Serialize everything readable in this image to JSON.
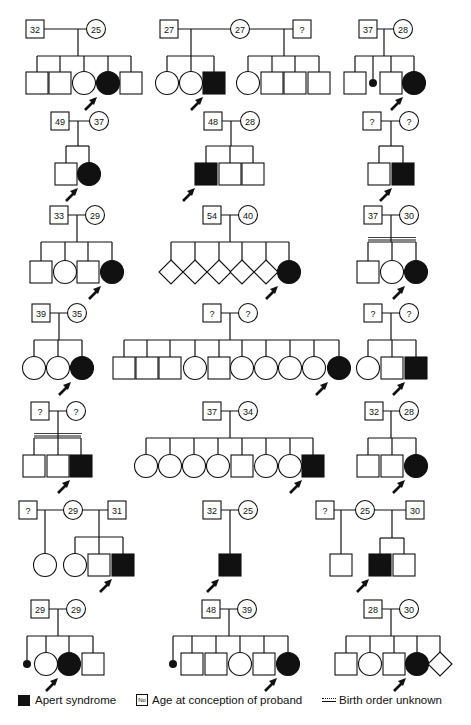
{
  "legend": {
    "affected_label": "Apert syndrome",
    "age_symbol_text": "No",
    "age_label": "Age at conception of proband",
    "birth_order_label": "Birth order unknown"
  },
  "pedigrees": [
    {
      "id": "p1",
      "father": "32",
      "mother": "25",
      "children": [
        "M",
        "M",
        "F",
        "F*",
        "M"
      ]
    },
    {
      "id": "p2",
      "father": "27",
      "mother": "27",
      "second_father": "?",
      "children_first": [
        "F",
        "F",
        "M*"
      ],
      "children_second": [
        "F",
        "M",
        "M",
        "M"
      ]
    },
    {
      "id": "p3",
      "father": "37",
      "mother": "28",
      "children": [
        "M",
        "sb",
        "M",
        "F*"
      ]
    },
    {
      "id": "p4",
      "father": "49",
      "mother": "37",
      "children": [
        "M",
        "F*"
      ]
    },
    {
      "id": "p5",
      "father": "48",
      "mother": "28",
      "children": [
        "M*",
        "M",
        "M"
      ]
    },
    {
      "id": "p6",
      "father": "?",
      "mother": "?",
      "children": [
        "M",
        "M*"
      ]
    },
    {
      "id": "p7",
      "father": "33",
      "mother": "29",
      "children": [
        "M",
        "F",
        "M",
        "F*"
      ]
    },
    {
      "id": "p8",
      "father": "54",
      "mother": "40",
      "children": [
        "U",
        "U",
        "U",
        "U",
        "U",
        "F*"
      ]
    },
    {
      "id": "p9",
      "father": "37",
      "mother": "30",
      "birth_order_unknown": true,
      "children": [
        "M",
        "F",
        "F*"
      ]
    },
    {
      "id": "p10",
      "father": "39",
      "mother": "35",
      "children": [
        "F",
        "F",
        "F*"
      ]
    },
    {
      "id": "p11",
      "father": "?",
      "mother": "?",
      "children": [
        "M",
        "M",
        "M",
        "F",
        "M",
        "F",
        "F",
        "F",
        "F",
        "F*"
      ]
    },
    {
      "id": "p12",
      "father": "?",
      "mother": "?",
      "children": [
        "F",
        "M",
        "M*"
      ]
    },
    {
      "id": "p13",
      "father": "?",
      "mother": "?",
      "birth_order_unknown": true,
      "children": [
        "M",
        "M",
        "M*"
      ]
    },
    {
      "id": "p14",
      "father": "37",
      "mother": "34",
      "children": [
        "F",
        "F",
        "F",
        "F",
        "M",
        "F",
        "F",
        "M*"
      ]
    },
    {
      "id": "p15",
      "father": "32",
      "mother": "28",
      "children": [
        "M",
        "M",
        "F*"
      ]
    },
    {
      "id": "p16",
      "first_father": "?",
      "mother": "29",
      "second_father": "31",
      "children_first": [
        "F"
      ],
      "children_second": [
        "F",
        "M",
        "M*"
      ]
    },
    {
      "id": "p17",
      "father": "32",
      "mother": "25",
      "children": [
        "M*"
      ]
    },
    {
      "id": "p18",
      "first_father": "?",
      "mother": "25",
      "second_father": "30",
      "children_first": [
        "M"
      ],
      "children_second": [
        "M*",
        "M"
      ]
    },
    {
      "id": "p19",
      "father": "29",
      "mother": "29",
      "children": [
        "sb",
        "F",
        "F*",
        "M"
      ]
    },
    {
      "id": "p20",
      "father": "48",
      "mother": "39",
      "children": [
        "sb",
        "M",
        "M",
        "F",
        "M",
        "F*"
      ]
    },
    {
      "id": "p21",
      "father": "28",
      "mother": "30",
      "children": [
        "M",
        "F",
        "M",
        "F*",
        "U"
      ]
    }
  ],
  "layout": [
    {
      "id": "p1",
      "px": 35,
      "py": 29,
      "cy": 83,
      "sibY": 56,
      "xs": [
        37,
        60,
        84,
        108,
        131
      ],
      "fx": 35,
      "mx": 96,
      "dropX": 78
    },
    {
      "id": "p2",
      "px": 0,
      "py": 29,
      "cy": 83,
      "sibY": 56,
      "fx": 169,
      "mx": 240,
      "f2x": 302,
      "dropX1": 191,
      "dropX2": 284,
      "xs1": [
        167,
        191,
        214
      ],
      "xs2": [
        248,
        272,
        295,
        319
      ]
    },
    {
      "id": "p3",
      "cy": 83,
      "sibY": 56,
      "fx": 368,
      "mx": 403,
      "dropX": 384,
      "xs": [
        355,
        373,
        391,
        414
      ]
    },
    {
      "id": "p4",
      "cy": 174,
      "sibY": 146,
      "fx": 60,
      "mx": 99,
      "dropX": 78,
      "xs": [
        66,
        89
      ],
      "py": 121
    },
    {
      "id": "p5",
      "cy": 174,
      "sibY": 146,
      "fx": 213,
      "mx": 250,
      "dropX": 231,
      "xs": [
        206,
        230,
        253
      ],
      "py": 121
    },
    {
      "id": "p6",
      "cy": 174,
      "sibY": 146,
      "fx": 372,
      "mx": 409,
      "dropX": 391,
      "xs": [
        379,
        403
      ],
      "py": 121
    },
    {
      "id": "p7",
      "cy": 272,
      "sibY": 242,
      "fx": 59,
      "mx": 95,
      "dropX": 77,
      "xs": [
        41,
        65,
        88,
        112
      ],
      "py": 215
    },
    {
      "id": "p8",
      "cy": 272,
      "sibY": 242,
      "fx": 212,
      "mx": 248,
      "dropX": 230,
      "xs": [
        171,
        195,
        219,
        242,
        266,
        289
      ],
      "py": 215
    },
    {
      "id": "p9",
      "cy": 272,
      "sibY": 242,
      "fx": 373,
      "mx": 409,
      "dropX": 391,
      "xs": [
        368,
        392,
        416
      ],
      "py": 215
    },
    {
      "id": "p10",
      "cy": 368,
      "sibY": 340,
      "fx": 41,
      "mx": 77,
      "dropX": 59,
      "xs": [
        34,
        58,
        82
      ],
      "py": 313
    },
    {
      "id": "p11",
      "cy": 368,
      "sibY": 340,
      "fx": 212,
      "mx": 248,
      "dropX": 230,
      "xs": [
        124,
        147,
        170,
        195,
        219,
        242,
        266,
        290,
        314,
        339
      ],
      "py": 313
    },
    {
      "id": "p12",
      "cy": 368,
      "sibY": 340,
      "fx": 373,
      "mx": 409,
      "dropX": 391,
      "xs": [
        368,
        392,
        416
      ],
      "py": 313
    },
    {
      "id": "p13",
      "cy": 466,
      "sibY": 438,
      "fx": 40,
      "mx": 76,
      "dropX": 58,
      "xs": [
        34,
        58,
        81
      ],
      "py": 411
    },
    {
      "id": "p14",
      "cy": 466,
      "sibY": 438,
      "fx": 212,
      "mx": 248,
      "dropX": 230,
      "xs": [
        146,
        170,
        194,
        218,
        242,
        266,
        290,
        313
      ],
      "py": 411
    },
    {
      "id": "p15",
      "cy": 466,
      "sibY": 438,
      "fx": 374,
      "mx": 409,
      "dropX": 391,
      "xs": [
        368,
        392,
        416
      ],
      "py": 411
    },
    {
      "id": "p16",
      "cy": 565,
      "sibY": 537,
      "f1x": 28,
      "mx": 73,
      "f2x": 117,
      "py": 510,
      "drop1X": 45,
      "dropX2": 99,
      "xs1": [
        45
      ],
      "xs2": [
        75,
        99,
        123
      ]
    },
    {
      "id": "p17",
      "cy": 565,
      "py": 510,
      "fx": 212,
      "mx": 248,
      "dropX": 230,
      "xs": [
        230
      ]
    },
    {
      "id": "p18",
      "cy": 565,
      "sibY": 538,
      "f1x": 325,
      "mx": 365,
      "f2x": 415,
      "py": 510,
      "drop1X": 341,
      "dropX2": 392,
      "xs1": [
        341
      ],
      "xs2": [
        380,
        404
      ]
    },
    {
      "id": "p19",
      "cy": 664,
      "sibY": 636,
      "fx": 40,
      "mx": 76,
      "dropX": 58,
      "xs": [
        27,
        46,
        69,
        93
      ],
      "py": 609
    },
    {
      "id": "p20",
      "cy": 664,
      "sibY": 636,
      "fx": 211,
      "mx": 247,
      "dropX": 229,
      "xs": [
        173,
        192,
        216,
        240,
        264,
        288
      ],
      "py": 609
    },
    {
      "id": "p21",
      "cy": 664,
      "sibY": 636,
      "fx": 373,
      "mx": 409,
      "dropX": 391,
      "xs": [
        346,
        370,
        394,
        417,
        440
      ],
      "py": 609
    }
  ]
}
